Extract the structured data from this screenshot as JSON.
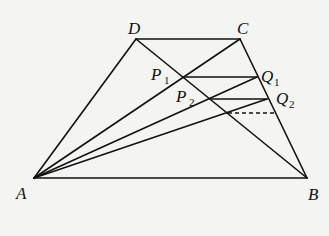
{
  "diagram": {
    "type": "geometry",
    "points": {
      "A": {
        "label": "A",
        "x": 34,
        "y": 178
      },
      "B": {
        "label": "B",
        "x": 307,
        "y": 178
      },
      "C": {
        "label": "C",
        "x": 240,
        "y": 39
      },
      "D": {
        "label": "D",
        "x": 136,
        "y": 39
      },
      "P1": {
        "label": "P",
        "sub": "1",
        "x": 183,
        "y": 77
      },
      "Q1": {
        "label": "Q",
        "sub": "1",
        "x": 257,
        "y": 77
      },
      "P2": {
        "label": "P",
        "sub": "2",
        "x": 210,
        "y": 99
      },
      "Q2": {
        "label": "Q",
        "sub": "2",
        "x": 267,
        "y": 99
      },
      "P3": {
        "x": 228,
        "y": 113
      },
      "Q3": {
        "x": 276,
        "y": 113
      }
    },
    "segments": [
      [
        "A",
        "B"
      ],
      [
        "B",
        "C"
      ],
      [
        "C",
        "D"
      ],
      [
        "D",
        "A"
      ],
      [
        "A",
        "C"
      ],
      [
        "B",
        "D"
      ],
      [
        "P1",
        "Q1"
      ],
      [
        "A",
        "Q1"
      ],
      [
        "P2",
        "Q2"
      ],
      [
        "A",
        "Q2"
      ]
    ],
    "dashed_segments": [
      [
        "P3",
        "Q3"
      ]
    ]
  }
}
